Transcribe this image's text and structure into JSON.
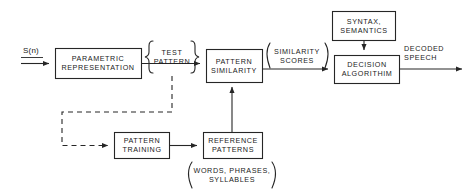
{
  "diagram": {
    "background_color": "#ffffff",
    "line_color": "#262626",
    "text_color": "#1a1a1a",
    "blocks": [
      {
        "id": "parametric-representation",
        "line1": "PARAMETRIC",
        "line2": "REPRESENTATION",
        "x": 55,
        "y": 48,
        "w": 86,
        "h": 30
      },
      {
        "id": "pattern-similarity",
        "line1": "PATTERN",
        "line2": "SIMILARITY",
        "x": 206,
        "y": 49,
        "w": 56,
        "h": 33
      },
      {
        "id": "decision-algorithm",
        "line1": "DECISION",
        "line2": "ALGORITHIM",
        "x": 334,
        "y": 55,
        "w": 65,
        "h": 28
      },
      {
        "id": "syntax-semantics",
        "line1": "SYNTAX,",
        "line2": "SEMANTICS",
        "x": 332,
        "y": 11,
        "w": 63,
        "h": 29
      },
      {
        "id": "pattern-training",
        "line1": "PATTERN",
        "line2": "TRAINING",
        "x": 114,
        "y": 132,
        "w": 55,
        "h": 26
      },
      {
        "id": "reference-patterns",
        "line1": "REFERENCE",
        "line2": "PATTERNS",
        "x": 203,
        "y": 132,
        "w": 59,
        "h": 26
      }
    ],
    "labels": [
      {
        "id": "input-signal",
        "text": "S(n)",
        "x": 30,
        "y": 56
      },
      {
        "id": "test-pattern",
        "line1": "TEST",
        "line2": "PATTERN",
        "x": 172,
        "y": 50
      },
      {
        "id": "similarity-scores",
        "line1": "SIMILARITY",
        "line2": "SCORES",
        "x": 297,
        "y": 51
      },
      {
        "id": "decoded-speech",
        "line1": "DECODED",
        "line2": "SPEECH",
        "x": 425,
        "y": 51
      },
      {
        "id": "words-phrases-syllables",
        "line1": "WORDS, PHRASES,",
        "line2": "SYLLABLES",
        "x": 232,
        "y": 171
      }
    ],
    "connectors": [
      {
        "id": "input-to-parametric",
        "style": "solid",
        "arrow": true
      },
      {
        "id": "parametric-to-similarity",
        "style": "solid",
        "arrow": true
      },
      {
        "id": "similarity-to-decision",
        "style": "solid",
        "arrow": true
      },
      {
        "id": "decision-to-output",
        "style": "solid",
        "arrow": true
      },
      {
        "id": "syntax-to-decision",
        "style": "solid",
        "arrow": true
      },
      {
        "id": "reference-to-similarity",
        "style": "solid",
        "arrow": true
      },
      {
        "id": "training-to-reference",
        "style": "solid",
        "arrow": true
      },
      {
        "id": "test-pattern-to-training",
        "style": "dashed",
        "arrow": true
      }
    ]
  }
}
